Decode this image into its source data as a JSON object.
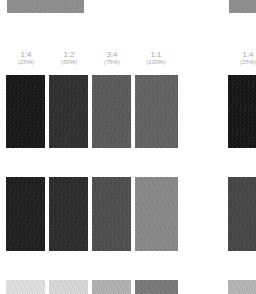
{
  "columns": [
    {
      "ratio": "1:4",
      "percent": "(25%)"
    },
    {
      "ratio": "1:2",
      "percent": "(50%)"
    },
    {
      "ratio": "3:4",
      "percent": "(75%)"
    },
    {
      "ratio": "1:1",
      "percent": "(100%)"
    }
  ],
  "right_column": {
    "ratio": "1:4",
    "percent": "(25%)"
  },
  "swatches": {
    "top_row": [
      "#8f8f8f",
      "#8f8f8f"
    ],
    "row1": [
      "#151515",
      "#2e2e2e",
      "#5a5a5a",
      "#626262"
    ],
    "row1_right": "#141414",
    "row2": [
      "#1c1c1c",
      "#2a2a2a",
      "#4e4e4e",
      "#8a8a8a"
    ],
    "row2_right": "#454545",
    "row3": [
      "#e4e4e4",
      "#dcdcdc",
      "#b4b4b4",
      "#7a7a7a"
    ],
    "row3_right": "#b8b8b8"
  }
}
